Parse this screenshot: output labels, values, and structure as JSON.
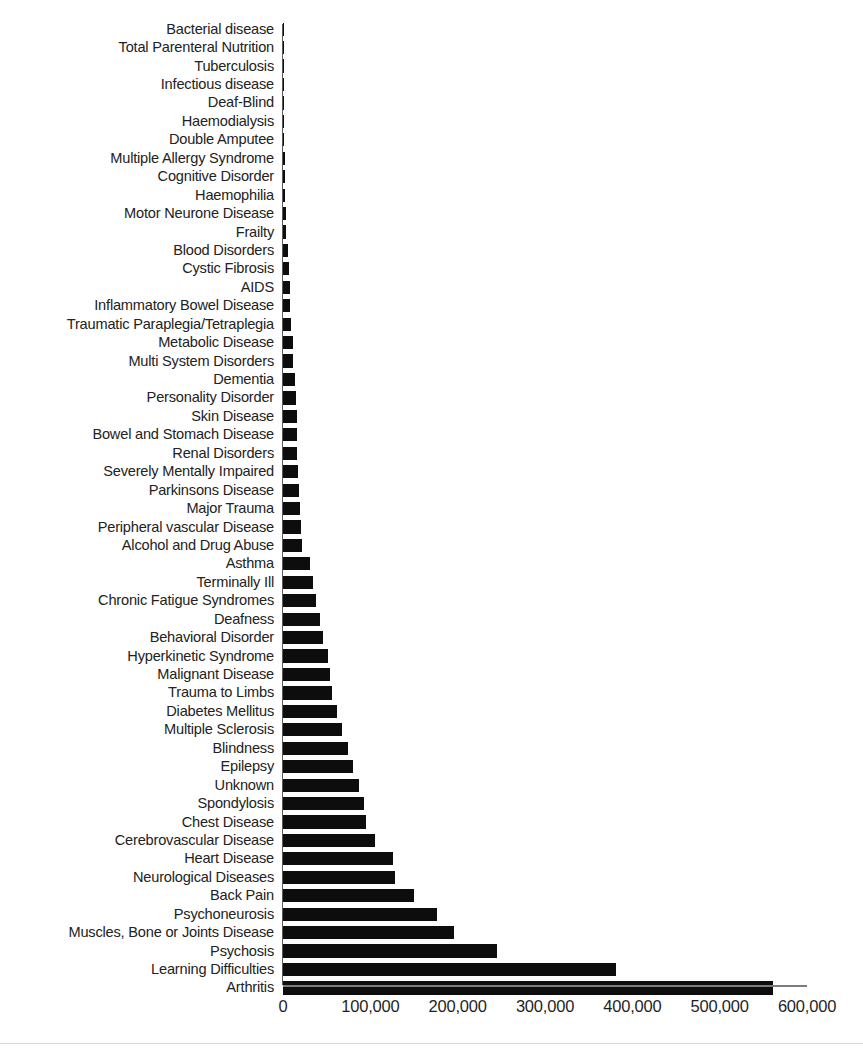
{
  "chart_data": {
    "type": "bar",
    "orientation": "horizontal",
    "title": "",
    "xlabel": "",
    "ylabel": "",
    "xlim": [
      0,
      600000
    ],
    "grid": false,
    "legend": null,
    "xticks": [
      "0",
      "100,000",
      "200,000",
      "300,000",
      "400,000",
      "500,000",
      "600,000"
    ],
    "xtick_values": [
      0,
      100000,
      200000,
      300000,
      400000,
      500000,
      600000
    ],
    "categories": [
      "Bacterial disease",
      "Total Parenteral Nutrition",
      "Tuberculosis",
      "Infectious disease",
      "Deaf-Blind",
      "Haemodialysis",
      "Double Amputee",
      "Multiple Allergy Syndrome",
      "Cognitive Disorder",
      "Haemophilia",
      "Motor Neurone Disease",
      "Frailty",
      "Blood Disorders",
      "Cystic Fibrosis",
      "AIDS",
      "Inflammatory Bowel Disease",
      "Traumatic Paraplegia/Tetraplegia",
      "Metabolic Disease",
      "Multi System Disorders",
      "Dementia",
      "Personality Disorder",
      "Skin Disease",
      "Bowel and Stomach Disease",
      "Renal Disorders",
      "Severely Mentally Impaired",
      "Parkinsons Disease",
      "Major Trauma",
      "Peripheral vascular Disease",
      "Alcohol and Drug Abuse",
      "Asthma",
      "Terminally Ill",
      "Chronic Fatigue Syndromes",
      "Deafness",
      "Behavioral Disorder",
      "Hyperkinetic Syndrome",
      "Malignant Disease",
      "Trauma to Limbs",
      "Diabetes Mellitus",
      "Multiple Sclerosis",
      "Blindness",
      "Epilepsy",
      "Unknown",
      "Spondylosis",
      "Chest Disease",
      "Cerebrovascular Disease",
      "Heart Disease",
      "Neurological Diseases",
      "Back Pain",
      "Psychoneurosis",
      "Muscles, Bone or Joints Disease",
      "Psychosis",
      "Learning Difficulties",
      "Arthritis"
    ],
    "values": [
      400,
      500,
      600,
      800,
      1000,
      1200,
      1600,
      1900,
      2200,
      2600,
      3200,
      3800,
      5500,
      6500,
      7500,
      8500,
      9500,
      11000,
      12000,
      14000,
      15000,
      15500,
      16000,
      16500,
      17500,
      18500,
      20000,
      21000,
      22000,
      31000,
      34000,
      38000,
      42000,
      46000,
      52000,
      54000,
      56000,
      62000,
      68000,
      74000,
      80000,
      87000,
      93000,
      95000,
      105000,
      126000,
      128000,
      150000,
      176000,
      196000,
      245000,
      381000,
      561000
    ],
    "bar_color": "#0d0d0d",
    "axis_color": "#7c7c7c"
  }
}
